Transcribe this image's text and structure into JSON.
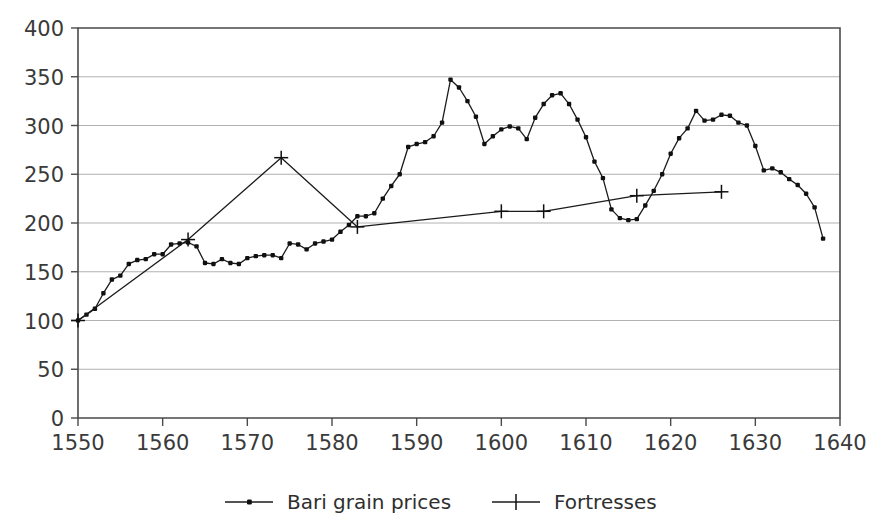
{
  "chart_data": {
    "type": "line",
    "title": "",
    "xlabel": "",
    "ylabel": "",
    "xlim": [
      1550,
      1640
    ],
    "ylim": [
      0,
      400
    ],
    "grid": true,
    "grid_axis": "y",
    "legend_position": "bottom",
    "x_ticks": [
      1550,
      1560,
      1570,
      1580,
      1590,
      1600,
      1610,
      1620,
      1630,
      1640
    ],
    "x_tick_labels": [
      "1550",
      "1560",
      "1570",
      "1580",
      "1590",
      "1600",
      "1610",
      "1620",
      "1630",
      "1640"
    ],
    "y_ticks": [
      0,
      50,
      100,
      150,
      200,
      250,
      300,
      350,
      400
    ],
    "y_tick_labels": [
      "0",
      "50",
      "100",
      "150",
      "200",
      "250",
      "300",
      "350",
      "400"
    ],
    "series": [
      {
        "name": "Bari grain prices",
        "marker": "dot",
        "legend_label": "Bari grain prices",
        "points": [
          [
            1550,
            100
          ],
          [
            1551,
            106
          ],
          [
            1552,
            112
          ],
          [
            1553,
            128
          ],
          [
            1554,
            142
          ],
          [
            1555,
            146
          ],
          [
            1556,
            158
          ],
          [
            1557,
            162
          ],
          [
            1558,
            163
          ],
          [
            1559,
            168
          ],
          [
            1560,
            168
          ],
          [
            1561,
            178
          ],
          [
            1562,
            179
          ],
          [
            1563,
            180
          ],
          [
            1564,
            176
          ],
          [
            1565,
            159
          ],
          [
            1566,
            158
          ],
          [
            1567,
            163
          ],
          [
            1568,
            159
          ],
          [
            1569,
            158
          ],
          [
            1570,
            164
          ],
          [
            1571,
            166
          ],
          [
            1572,
            167
          ],
          [
            1573,
            167
          ],
          [
            1574,
            164
          ],
          [
            1575,
            179
          ],
          [
            1576,
            178
          ],
          [
            1577,
            173
          ],
          [
            1578,
            179
          ],
          [
            1579,
            181
          ],
          [
            1580,
            183
          ],
          [
            1581,
            191
          ],
          [
            1582,
            198
          ],
          [
            1583,
            207
          ],
          [
            1584,
            207
          ],
          [
            1585,
            210
          ],
          [
            1586,
            225
          ],
          [
            1587,
            238
          ],
          [
            1588,
            250
          ],
          [
            1589,
            278
          ],
          [
            1590,
            281
          ],
          [
            1591,
            283
          ],
          [
            1592,
            289
          ],
          [
            1593,
            303
          ],
          [
            1594,
            347
          ],
          [
            1595,
            339
          ],
          [
            1596,
            325
          ],
          [
            1597,
            309
          ],
          [
            1598,
            281
          ],
          [
            1599,
            289
          ],
          [
            1600,
            296
          ],
          [
            1601,
            299
          ],
          [
            1602,
            297
          ],
          [
            1603,
            286
          ],
          [
            1604,
            308
          ],
          [
            1605,
            322
          ],
          [
            1606,
            331
          ],
          [
            1607,
            333
          ],
          [
            1608,
            322
          ],
          [
            1609,
            306
          ],
          [
            1610,
            288
          ],
          [
            1611,
            263
          ],
          [
            1612,
            246
          ],
          [
            1613,
            214
          ],
          [
            1614,
            205
          ],
          [
            1615,
            203
          ],
          [
            1616,
            204
          ],
          [
            1617,
            218
          ],
          [
            1618,
            233
          ],
          [
            1619,
            250
          ],
          [
            1620,
            271
          ],
          [
            1621,
            287
          ],
          [
            1622,
            297
          ],
          [
            1623,
            315
          ],
          [
            1624,
            305
          ],
          [
            1625,
            306
          ],
          [
            1626,
            311
          ],
          [
            1627,
            310
          ],
          [
            1628,
            303
          ],
          [
            1629,
            300
          ],
          [
            1630,
            279
          ],
          [
            1631,
            254
          ],
          [
            1632,
            256
          ],
          [
            1633,
            252
          ],
          [
            1634,
            245
          ],
          [
            1635,
            239
          ],
          [
            1636,
            230
          ],
          [
            1637,
            216
          ],
          [
            1638,
            184
          ]
        ]
      },
      {
        "name": "Fortresses",
        "marker": "plus",
        "legend_label": "Fortresses",
        "points": [
          [
            1550,
            100
          ],
          [
            1563,
            183
          ],
          [
            1574,
            267
          ],
          [
            1583,
            196
          ],
          [
            1600,
            212
          ],
          [
            1605,
            212
          ],
          [
            1616,
            228
          ],
          [
            1626,
            232
          ]
        ]
      }
    ]
  },
  "legend": {
    "entries": [
      {
        "label": "Bari grain prices",
        "marker": "dot-line-marker"
      },
      {
        "label": "Fortresses",
        "marker": "plus-line-marker"
      }
    ]
  },
  "colors": {
    "ink": "#1b1b1b",
    "grid": "#a8a8a8",
    "axis": "#4a4a4a",
    "background": "#ffffff"
  }
}
